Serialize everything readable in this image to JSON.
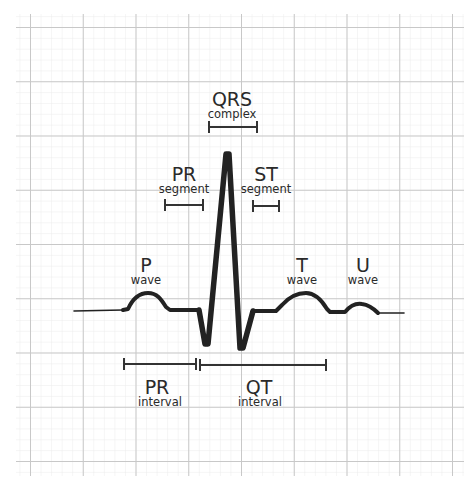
{
  "diagram": {
    "colors": {
      "background": "#ffffff",
      "grid_minor": "#ebebeb",
      "grid_major": "#c9c9c9",
      "trace": "#222222",
      "text": "#2a2a2a"
    },
    "labels": {
      "qrs": {
        "main": "QRS",
        "sub": "complex"
      },
      "pr_segment": {
        "main": "PR",
        "sub": "segment"
      },
      "st_segment": {
        "main": "ST",
        "sub": "segment"
      },
      "p_wave": {
        "main": "P",
        "sub": "wave"
      },
      "t_wave": {
        "main": "T",
        "sub": "wave"
      },
      "u_wave": {
        "main": "U",
        "sub": "wave"
      },
      "pr_interval": {
        "main": "PR",
        "sub": "interval"
      },
      "qt_interval": {
        "main": "QT",
        "sub": "interval"
      }
    }
  }
}
